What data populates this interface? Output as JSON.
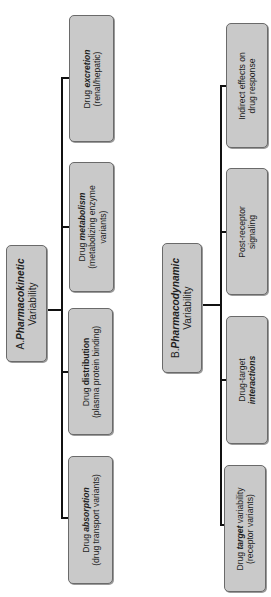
{
  "orientation": "rotated 90deg counter-clockwise",
  "colors": {
    "box_fill": "#c9c9c9",
    "box_border": "#6a6a6a",
    "connector": "#111111",
    "background": "#ffffff"
  },
  "panel_a": {
    "header": {
      "prefix": "A.",
      "emphasis": "Pharmacokinetic",
      "line2": "Variability"
    },
    "children": [
      {
        "pre": "Drug ",
        "emphasis": "absorption",
        "post": "",
        "line2": "(drug transport variants)",
        "line3": ""
      },
      {
        "pre": "Drug ",
        "emphasis": "distribution",
        "post": "",
        "line2": "(plasma protein binding)",
        "line3": ""
      },
      {
        "pre": "Drug ",
        "emphasis": "metabolism",
        "post": "",
        "line2": "(metabolizing enzyme",
        "line3": "variants)"
      },
      {
        "pre": "Drug ",
        "emphasis": "excretion",
        "post": "",
        "line2": "(renal/hepatic)",
        "line3": ""
      }
    ]
  },
  "panel_b": {
    "header": {
      "prefix": "B.",
      "emphasis": "Pharmacodynamic",
      "line2": "Variability"
    },
    "children": [
      {
        "pre": "Drug ",
        "emphasis": "target",
        "post": " variability",
        "line2": "(receptor variants)"
      },
      {
        "line1": "Drug-target",
        "line2": "interactions"
      },
      {
        "line1": "Post-receptor",
        "line2": "signaling"
      },
      {
        "line1": "Indirect effects on",
        "line2": "drug response"
      }
    ]
  }
}
